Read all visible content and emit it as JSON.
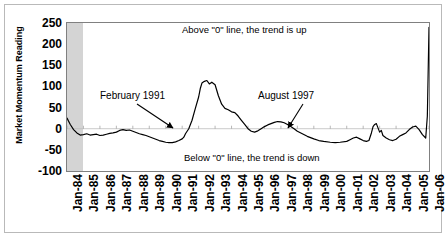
{
  "chart_data": {
    "type": "line",
    "title": "",
    "xlabel": "",
    "ylabel": "Market Momentum Reading",
    "ylim": [
      -100,
      250
    ],
    "ytick_labels": [
      "250",
      "200",
      "150",
      "100",
      "50",
      "0",
      "-50",
      "-100"
    ],
    "ytick_values": [
      250,
      200,
      150,
      100,
      50,
      0,
      -50,
      -100
    ],
    "grid": false,
    "legend": "none",
    "zero_line": 0,
    "shaded_region": {
      "from": "Jan-84",
      "to": "Jan-85",
      "color": "#d4d4d4"
    },
    "categories": [
      "Jan-84",
      "Jan-85",
      "Jan-86",
      "Jan-87",
      "Jan-88",
      "Jan-89",
      "Jan-90",
      "Jan-91",
      "Jan-92",
      "Jan-93",
      "Jan-94",
      "Jan-95",
      "Jan-96",
      "Jan-97",
      "Jan-98",
      "Jan-99",
      "Jan-00",
      "Jan-01",
      "Jan-02",
      "Jan-03",
      "Jan-04",
      "Jan-05",
      "Jan-06"
    ],
    "series": [
      {
        "name": "Market Momentum Reading",
        "color": "#000000",
        "x": [
          1984.0,
          1984.2,
          1984.4,
          1984.6,
          1984.8,
          1985.0,
          1985.2,
          1985.4,
          1985.6,
          1985.8,
          1986.0,
          1986.2,
          1986.4,
          1986.6,
          1986.8,
          1987.0,
          1987.2,
          1987.4,
          1987.6,
          1987.8,
          1988.0,
          1988.2,
          1988.4,
          1988.6,
          1988.8,
          1989.0,
          1989.2,
          1989.4,
          1989.6,
          1989.8,
          1990.0,
          1990.2,
          1990.4,
          1990.6,
          1990.8,
          1991.0,
          1991.1,
          1991.2,
          1991.4,
          1991.6,
          1991.8,
          1992.0,
          1992.1,
          1992.2,
          1992.35,
          1992.5,
          1992.65,
          1992.8,
          1993.0,
          1993.2,
          1993.4,
          1993.6,
          1993.8,
          1994.0,
          1994.2,
          1994.4,
          1994.6,
          1994.8,
          1995.0,
          1995.2,
          1995.4,
          1995.6,
          1995.8,
          1996.0,
          1996.2,
          1996.4,
          1996.6,
          1996.8,
          1997.0,
          1997.2,
          1997.4,
          1997.6,
          1997.8,
          1998.0,
          1998.3,
          1998.6,
          1999.0,
          1999.3,
          1999.6,
          2000.0,
          2000.3,
          2000.6,
          2001.0,
          2001.2,
          2001.4,
          2001.6,
          2001.8,
          2002.0,
          2002.2,
          2002.35,
          2002.5,
          2002.6,
          2002.7,
          2002.8,
          2002.9,
          2003.0,
          2003.1,
          2003.2,
          2003.4,
          2003.6,
          2003.8,
          2004.0,
          2004.2,
          2004.4,
          2004.6,
          2004.8,
          2005.0,
          2005.2,
          2005.4,
          2005.6,
          2005.8,
          2005.9,
          2006.0
        ],
        "values": [
          25,
          10,
          -2,
          -10,
          -15,
          -14,
          -12,
          -15,
          -14,
          -13,
          -16,
          -15,
          -13,
          -11,
          -10,
          -8,
          -4,
          -2,
          -4,
          -3,
          -6,
          -9,
          -12,
          -14,
          -16,
          -19,
          -22,
          -25,
          -28,
          -30,
          -32,
          -33,
          -33,
          -31,
          -28,
          -24,
          -20,
          -12,
          0,
          20,
          48,
          75,
          95,
          108,
          112,
          114,
          106,
          110,
          104,
          78,
          58,
          48,
          45,
          40,
          38,
          30,
          20,
          10,
          0,
          -6,
          -8,
          -5,
          0,
          5,
          9,
          12,
          15,
          17,
          16,
          14,
          10,
          5,
          0,
          -6,
          -12,
          -18,
          -24,
          -28,
          -30,
          -32,
          -33,
          -32,
          -30,
          -26,
          -22,
          -20,
          -24,
          -28,
          -30,
          -28,
          -10,
          5,
          10,
          12,
          2,
          -8,
          -4,
          -16,
          -22,
          -26,
          -28,
          -25,
          -18,
          -14,
          -10,
          -2,
          4,
          6,
          -2,
          -14,
          -22,
          30,
          240
        ]
      }
    ],
    "annotations": [
      {
        "name": "above-zero-note",
        "text": "Above \"0\" line, the trend is up"
      },
      {
        "name": "below-zero-note",
        "text": "Below \"0\" line, the trend is down"
      },
      {
        "name": "feb-1991-label",
        "text": "February 1991"
      },
      {
        "name": "aug-1997-label",
        "text": "August 1997"
      }
    ]
  },
  "axis": {
    "y_title": "Market Momentum Reading",
    "y_ticks": [
      "250",
      "200",
      "150",
      "100",
      "50",
      "0",
      "-50",
      "-100"
    ],
    "x_ticks": [
      "Jan-84",
      "Jan-85",
      "Jan-86",
      "Jan-87",
      "Jan-88",
      "Jan-89",
      "Jan-90",
      "Jan-91",
      "Jan-92",
      "Jan-93",
      "Jan-94",
      "Jan-95",
      "Jan-96",
      "Jan-97",
      "Jan-98",
      "Jan-99",
      "Jan-00",
      "Jan-01",
      "Jan-02",
      "Jan-03",
      "Jan-04",
      "Jan-05",
      "Jan-06"
    ]
  },
  "notes": {
    "above": "Above \"0\" line, the trend is up",
    "below": "Below \"0\" line, the trend is down",
    "feb1991": "February 1991",
    "aug1997": "August 1997"
  },
  "colors": {
    "line": "#000000",
    "shaded_band": "#d4d4d4",
    "plot_border": "#808080",
    "figure_border": "#b9b9b9",
    "zero_line": "#bdbdbd"
  }
}
